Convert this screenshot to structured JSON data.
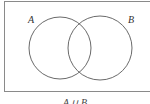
{
  "diagram": {
    "type": "venn",
    "sets": [
      {
        "label": "A",
        "cx": 60,
        "cy": 48,
        "r": 31
      },
      {
        "label": "B",
        "cx": 100,
        "cy": 48,
        "r": 32
      }
    ],
    "caption": "A ∪ B",
    "colors": {
      "stroke": "#6a6a6a",
      "frame": "#8a8a8a",
      "background": "#ffffff"
    }
  }
}
